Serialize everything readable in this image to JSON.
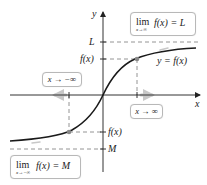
{
  "diagram": {
    "axes": {
      "x_label": "x",
      "y_label": "y"
    },
    "tick_labels": {
      "L": "L",
      "fx_upper": "f(x)",
      "fx_lower": "f(x)",
      "M": "M"
    },
    "curve_label": "y = f(x)",
    "boxes": {
      "limit_plus_inf": {
        "lim": "lim",
        "subscript": "x→∞",
        "expression": "f(x) = L"
      },
      "limit_minus_inf": {
        "lim": "lim",
        "subscript": "x→−∞",
        "expression": "f(x) = M"
      },
      "x_to_neg_inf": "x → −∞",
      "x_to_pos_inf": "x → ∞"
    },
    "colors": {
      "curve": "#1a1a1a",
      "axis": "#333333",
      "dashed": "#888888",
      "point": "#888888",
      "motion_arrow": "#c8c8c8",
      "box_border": "#b8b8b8"
    }
  }
}
